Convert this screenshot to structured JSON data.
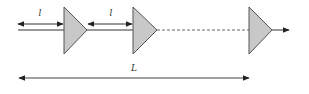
{
  "diagram": {
    "colors": {
      "line": "#333333",
      "amplifier_fill": "#c8c8c8",
      "amplifier_stroke": "#555555",
      "dashed": "#666666",
      "background": "#ffffff"
    },
    "labels": {
      "span_1": "l",
      "span_2": "l",
      "total": "L"
    },
    "amplifiers": [
      {
        "id": "amp-1",
        "x_left": 64,
        "x_tip": 87,
        "y_top": 7,
        "y_bottom": 54
      },
      {
        "id": "amp-2",
        "x_left": 133,
        "x_tip": 157,
        "y_top": 7,
        "y_bottom": 54
      },
      {
        "id": "amp-3",
        "x_left": 249,
        "x_tip": 272,
        "y_top": 7,
        "y_bottom": 54
      }
    ],
    "span_arrows": [
      {
        "id": "span-1",
        "x1": 18,
        "x2": 63,
        "y": 24,
        "label": "l"
      },
      {
        "id": "span-2",
        "x1": 88,
        "x2": 132,
        "y": 24,
        "label": "l"
      }
    ],
    "total_arrow": {
      "x1": 19,
      "x2": 249,
      "y": 78,
      "label": "L"
    }
  }
}
